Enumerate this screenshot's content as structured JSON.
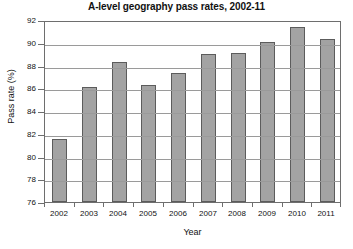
{
  "chart_data": {
    "type": "bar",
    "title": "A-level geography pass rates, 2002-11",
    "xlabel": "Year",
    "ylabel": "Pass rate (%)",
    "categories": [
      "2002",
      "2003",
      "2004",
      "2005",
      "2006",
      "2007",
      "2008",
      "2009",
      "2010",
      "2011"
    ],
    "values": [
      81.5,
      86.1,
      88.3,
      86.3,
      87.3,
      89.0,
      89.1,
      90.1,
      91.4,
      90.3
    ],
    "ylim": [
      76,
      92
    ],
    "yticks": [
      "92",
      "90",
      "88",
      "86",
      "84",
      "82",
      "80",
      "78",
      "76"
    ],
    "grid": true,
    "legend": "none",
    "bar_color": "#a3a3a3",
    "bar_border_color": "#5c5c5c",
    "grid_color": "#9a9a9a",
    "axis_color": "#6e6e6e",
    "background": "#ffffff"
  }
}
